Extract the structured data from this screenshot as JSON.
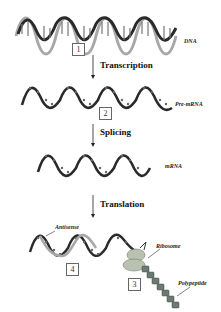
{
  "figure": {
    "stages": [
      {
        "id": "dna",
        "label": "DNA",
        "number": "1"
      },
      {
        "id": "pre-mrna",
        "label": "Pre-mRNA",
        "number": "2"
      },
      {
        "id": "mrna",
        "label": "mRNA"
      },
      {
        "id": "translation-complex",
        "labels": {
          "antisense": "Antisense",
          "ribosome": "Ribosome",
          "polypeptide": "Polypeptide"
        },
        "numbers": {
          "ribosome": "3",
          "antisense": "4"
        }
      }
    ],
    "steps": [
      {
        "label": "Transcription"
      },
      {
        "label": "Splicing"
      },
      {
        "label": "Translation"
      }
    ]
  },
  "colors": {
    "strand_dark": "#2a2a2a",
    "strand_light": "#a8a8a8",
    "ribosome": "#b9c2b0",
    "polypeptide_bead": "#6b7a72"
  }
}
